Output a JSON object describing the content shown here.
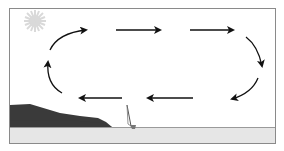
{
  "diagram": {
    "colors": {
      "frame": "#8a8a8a",
      "sky": "#ffffff",
      "sea": "#e6e6e6",
      "land": "#3a3a3a",
      "sun": "#d9d9d9",
      "arrow": "#111111"
    },
    "elements": [
      "sun",
      "circulation-arrows",
      "land-cliff",
      "sea-surface",
      "sailboat"
    ],
    "arrows": [
      {
        "id": "top-1",
        "direction": "right"
      },
      {
        "id": "top-2",
        "direction": "right"
      },
      {
        "id": "top-3",
        "direction": "right"
      },
      {
        "id": "right-curve",
        "direction": "down"
      },
      {
        "id": "bottom-curve-right",
        "direction": "down-left"
      },
      {
        "id": "bottom-1",
        "direction": "left"
      },
      {
        "id": "bottom-2",
        "direction": "left"
      },
      {
        "id": "left-curve-bottom",
        "direction": "up"
      },
      {
        "id": "left-curve-top",
        "direction": "up-right"
      }
    ]
  }
}
